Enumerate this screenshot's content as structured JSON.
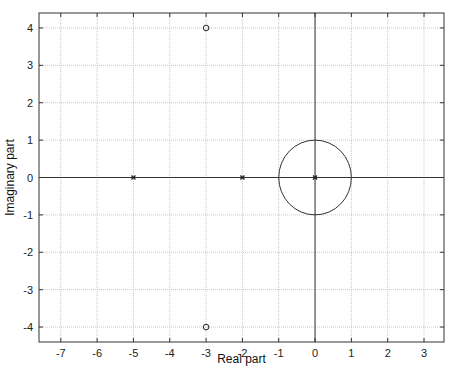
{
  "chart_data": {
    "type": "scatter",
    "title": "",
    "subtitle": "pole-zero map",
    "xlabel": "Real part",
    "ylabel": "Imaginary part",
    "xlim": [
      -7.6,
      3.55
    ],
    "ylim": [
      -4.4,
      4.4
    ],
    "xticks": [
      -7,
      -6,
      -5,
      -4,
      -3,
      -2,
      -1,
      0,
      1,
      2,
      3
    ],
    "yticks": [
      -4,
      -3,
      -2,
      -1,
      0,
      1,
      2,
      3,
      4
    ],
    "grid": true,
    "legend": null,
    "series": [
      {
        "name": "poles",
        "marker": "x",
        "points": [
          [
            -5,
            0
          ],
          [
            -2,
            0
          ],
          [
            0,
            0
          ]
        ]
      },
      {
        "name": "zeros",
        "marker": "o",
        "points": [
          [
            -3,
            4
          ],
          [
            -3,
            -4
          ]
        ]
      }
    ],
    "annotations": [
      {
        "type": "unit-circle",
        "center": [
          0,
          0
        ],
        "radius": 1
      },
      {
        "type": "axis-line",
        "orientation": "horizontal",
        "at": 0
      },
      {
        "type": "axis-line",
        "orientation": "vertical",
        "at": 0
      }
    ]
  },
  "colors": {
    "axes": "#333333",
    "grid": "#c8c8c8",
    "markers": "#222222"
  }
}
